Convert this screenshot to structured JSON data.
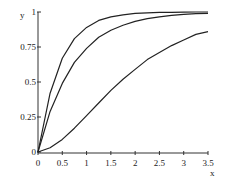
{
  "chart_data": {
    "type": "line",
    "title": "",
    "xlabel": "x",
    "ylabel": "y",
    "xlim": [
      0,
      3.5
    ],
    "ylim": [
      0,
      1
    ],
    "grid": false,
    "legend": null,
    "x_ticks": [
      "0",
      "0.5",
      "1",
      "1.5",
      "2",
      "2.5",
      "3",
      "3.5"
    ],
    "y_ticks": [
      "0",
      "0.25",
      "0.5",
      "0.75",
      "1"
    ],
    "x": [
      0,
      0.25,
      0.5,
      0.75,
      1,
      1.25,
      1.5,
      1.75,
      2,
      2.25,
      2.5,
      2.75,
      3,
      3.25,
      3.5
    ],
    "series": [
      {
        "name": "curve-top",
        "values": [
          0,
          0.42,
          0.67,
          0.81,
          0.89,
          0.94,
          0.965,
          0.98,
          0.99,
          0.994,
          0.997,
          0.998,
          0.999,
          1.0,
          1.0
        ]
      },
      {
        "name": "curve-middle",
        "values": [
          0,
          0.29,
          0.49,
          0.64,
          0.74,
          0.82,
          0.87,
          0.905,
          0.933,
          0.952,
          0.966,
          0.976,
          0.983,
          0.988,
          0.991
        ]
      },
      {
        "name": "curve-bottom",
        "values": [
          0,
          0.03,
          0.09,
          0.17,
          0.26,
          0.35,
          0.44,
          0.52,
          0.59,
          0.66,
          0.71,
          0.76,
          0.8,
          0.84,
          0.86
        ]
      }
    ]
  }
}
